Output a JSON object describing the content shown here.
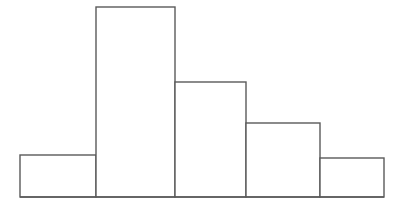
{
  "chart_data": {
    "type": "bar",
    "title": "",
    "subtitle": "",
    "xlabel": "",
    "ylabel": "",
    "categories": [
      "1",
      "2",
      "3",
      "4",
      "5"
    ],
    "values": [
      42,
      190,
      115,
      74,
      39
    ],
    "bin_edges": [
      20,
      96,
      175,
      246,
      320,
      384
    ],
    "bar_widths": [
      76,
      79,
      71,
      74,
      64
    ],
    "ylim": [
      0,
      197
    ],
    "xlim": [
      20,
      384
    ],
    "grid": false,
    "legend": null,
    "tick_labels_x": [],
    "tick_labels_y": [],
    "annotations": []
  },
  "figure": {
    "background_color": "#ffffff",
    "line_color": "#5a5a5a",
    "fill_color": "#ffffff",
    "line_width": 1.4,
    "width": 398,
    "height": 207,
    "baseline_y": 197
  },
  "bars": [
    {
      "name": "bar-1",
      "x": 20,
      "y": 155,
      "width": 76,
      "height": 42
    },
    {
      "name": "bar-2",
      "x": 96,
      "y": 7,
      "width": 79,
      "height": 190
    },
    {
      "name": "bar-3",
      "x": 175,
      "y": 82,
      "width": 71,
      "height": 115
    },
    {
      "name": "bar-4",
      "x": 246,
      "y": 123,
      "width": 74,
      "height": 74
    },
    {
      "name": "bar-5",
      "x": 320,
      "y": 158,
      "width": 64,
      "height": 39
    }
  ]
}
